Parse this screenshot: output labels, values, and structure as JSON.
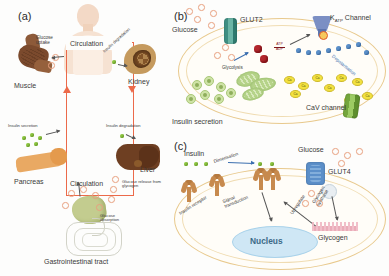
{
  "figure": {
    "panels": [
      {
        "id": "a",
        "label": "(a)",
        "title": "Systemic glucose and insulin circulation",
        "center_label": "Circulation",
        "organs": [
          {
            "name": "Muscle",
            "label": "Muscle"
          },
          {
            "name": "Kidney",
            "label": "Kidney"
          },
          {
            "name": "Pancreas",
            "label": "Pancreas"
          },
          {
            "name": "Liver",
            "label": "Liver"
          },
          {
            "name": "Gastrointestinal tract",
            "label": "Gastrointestinal tract"
          }
        ],
        "processes": [
          {
            "name": "glucose-uptake",
            "label": "Glucose uptake"
          },
          {
            "name": "insulin-degradation-kidney",
            "label": "Insulin degradation"
          },
          {
            "name": "insulin-secretion",
            "label": "Insulin secretion"
          },
          {
            "name": "insulin-degradation-liver",
            "label": "Insulin degradation"
          },
          {
            "name": "glucose-release",
            "label": "Glucose release from glycogen"
          },
          {
            "name": "glucose-absorption",
            "label": "Glucose absorption"
          }
        ]
      },
      {
        "id": "b",
        "label": "(b)",
        "title": "Beta cell insulin secretion pathway",
        "items": [
          {
            "name": "glucose",
            "label": "Glucose"
          },
          {
            "name": "glut2",
            "label": "GLUT2"
          },
          {
            "name": "glycolysis",
            "label": "Glycolysis"
          },
          {
            "name": "atp-adp-ratio",
            "label": "ATP / ADP"
          },
          {
            "name": "katp-channel",
            "label": "K",
            "sub": "ATP",
            "suffix": " Channel"
          },
          {
            "name": "depolarisation",
            "label": "Depolarisation"
          },
          {
            "name": "cav-channel",
            "label": "CaV channel"
          },
          {
            "name": "insulin-secretion",
            "label": "Insulin secretion"
          },
          {
            "name": "calcium-ion",
            "label": "Ca"
          }
        ]
      },
      {
        "id": "c",
        "label": "(c)",
        "title": "Insulin signalling in target cell",
        "items": [
          {
            "name": "insulin",
            "label": "Insulin"
          },
          {
            "name": "insulin-receptor",
            "label": "Insulin receptor"
          },
          {
            "name": "dimerisation",
            "label": "Dimerisation"
          },
          {
            "name": "signal-transduction",
            "label": "Signal transduction"
          },
          {
            "name": "nucleus",
            "label": "Nucleus"
          },
          {
            "name": "upregulate",
            "label": "Upregulate"
          },
          {
            "name": "glucose",
            "label": "Glucose"
          },
          {
            "name": "glut4",
            "label": "GLUT4"
          },
          {
            "name": "glycogen-synthase",
            "label": "Glycogen synthase"
          },
          {
            "name": "glycogen",
            "label": "Glycogen"
          }
        ]
      }
    ],
    "colors": {
      "circulation_border": "#ec6a4a",
      "cell_membrane": "#e8c98d",
      "glucose_dot": "#e8a07f",
      "insulin_dot": "#8dc63f",
      "calcium": "#f3e23f",
      "potassium": "#5b8fc9",
      "glut2": "#3f8f83",
      "glut4": "#5b8fc9",
      "katp": "#7b8fc4",
      "cav": "#74a63c",
      "nucleus": "#cfe7f5",
      "atp": "#b3272d"
    }
  }
}
